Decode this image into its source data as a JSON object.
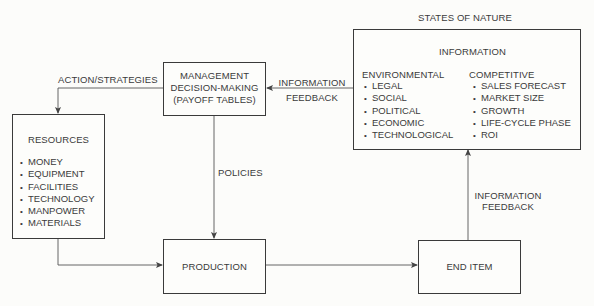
{
  "diagram": {
    "states_of_nature": "STATES OF NATURE",
    "management": {
      "lines": [
        "MANAGEMENT",
        "DECISION-MAKING",
        "(PAYOFF TABLES)"
      ]
    },
    "information": {
      "title": "INFORMATION",
      "environmental": {
        "heading": "ENVIRONMENTAL",
        "items": [
          "LEGAL",
          "SOCIAL",
          "POLITICAL",
          "ECONOMIC",
          "TECHNOLOGICAL"
        ]
      },
      "competitive": {
        "heading": "COMPETITIVE",
        "items": [
          "SALES FORECAST",
          "MARKET SIZE",
          "GROWTH",
          "LIFE-CYCLE PHASE",
          "ROI"
        ]
      }
    },
    "resources": {
      "title": "RESOURCES",
      "items": [
        "MONEY",
        "EQUIPMENT",
        "FACILITIES",
        "TECHNOLOGY",
        "MANPOWER",
        "MATERIALS"
      ]
    },
    "production": "PRODUCTION",
    "end_item": "END ITEM",
    "edges": {
      "action_strategies": "ACTION/STRATEGIES",
      "info_feedback_top": [
        "INFORMATION",
        "FEEDBACK"
      ],
      "policies": "POLICIES",
      "info_feedback_right": [
        "INFORMATION",
        "FEEDBACK"
      ]
    }
  }
}
